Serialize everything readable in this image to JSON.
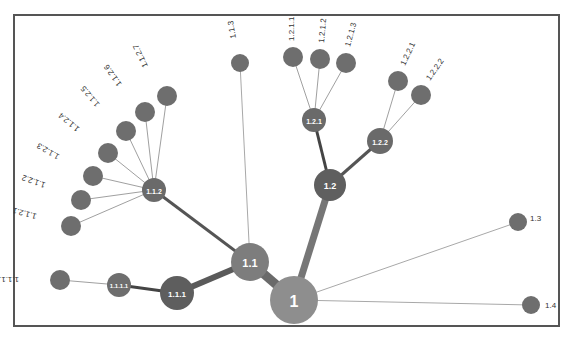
{
  "diagram": {
    "type": "radial-tree",
    "colors": {
      "root": "#8e8e8e",
      "mid": "#7a7a7a",
      "dark": "#5e5e5e",
      "leaf": "#6e6e6e",
      "edge_thin": "#9a9a9a",
      "edge_thick": "#5a5a5a",
      "border": "#555555"
    },
    "nodes": [
      {
        "id": "1",
        "label": "1",
        "x": 294,
        "y": 300,
        "r": 24,
        "fill": "#8e8e8e",
        "inside": true,
        "fs": 16
      },
      {
        "id": "1.1",
        "label": "1.1",
        "x": 250,
        "y": 262,
        "r": 19,
        "fill": "#7d7d7d",
        "inside": true,
        "fs": 11
      },
      {
        "id": "1.2",
        "label": "1.2",
        "x": 330,
        "y": 185,
        "r": 16,
        "fill": "#5f5f5f",
        "inside": true,
        "fs": 9
      },
      {
        "id": "1.3",
        "label": "1.3",
        "x": 518,
        "y": 222,
        "r": 9,
        "fill": "#6e6e6e",
        "inside": false,
        "lx": 530,
        "ly": 221,
        "rot": 0
      },
      {
        "id": "1.4",
        "label": "1.4",
        "x": 531,
        "y": 305,
        "r": 9,
        "fill": "#6e6e6e",
        "inside": false,
        "lx": 545,
        "ly": 308,
        "rot": 0
      },
      {
        "id": "1.1.1",
        "label": "1.1.1",
        "x": 177,
        "y": 293,
        "r": 17,
        "fill": "#5e5e5e",
        "inside": true,
        "fs": 8
      },
      {
        "id": "1.1.2",
        "label": "1.1.2",
        "x": 154,
        "y": 190,
        "r": 12,
        "fill": "#6a6a6a",
        "inside": true,
        "fs": 7
      },
      {
        "id": "1.1.3",
        "label": "1.1.3",
        "x": 240,
        "y": 63,
        "r": 9,
        "fill": "#6e6e6e",
        "inside": false,
        "lx": 236,
        "ly": 38,
        "rot": 260
      },
      {
        "id": "1.1.1.1",
        "label": "1.1.1.1",
        "x": 119,
        "y": 285,
        "r": 12,
        "fill": "#6e6e6e",
        "inside": true,
        "fs": 6
      },
      {
        "id": "1.1.1.1.1",
        "label": "1.1.1.1.1",
        "x": 60,
        "y": 280,
        "r": 10,
        "fill": "#6e6e6e",
        "inside": false,
        "lx": 19,
        "ly": 277,
        "rot": 180
      },
      {
        "id": "1.1.2.1",
        "label": "1.1.2.1",
        "x": 71,
        "y": 226,
        "r": 10,
        "fill": "#6e6e6e",
        "inside": false,
        "lx": 37,
        "ly": 214,
        "rot": 195
      },
      {
        "id": "1.1.2.2",
        "label": "1.1.2.2",
        "x": 81,
        "y": 200,
        "r": 10,
        "fill": "#6e6e6e",
        "inside": false,
        "lx": 46,
        "ly": 183,
        "rot": 200
      },
      {
        "id": "1.1.2.3",
        "label": "1.1.2.3",
        "x": 93,
        "y": 176,
        "r": 10,
        "fill": "#6e6e6e",
        "inside": false,
        "lx": 60,
        "ly": 155,
        "rot": 210
      },
      {
        "id": "1.1.2.4",
        "label": "1.1.2.4",
        "x": 108,
        "y": 153,
        "r": 10,
        "fill": "#6e6e6e",
        "inside": false,
        "lx": 80,
        "ly": 128,
        "rot": 220
      },
      {
        "id": "1.1.2.5",
        "label": "1.1.2.5",
        "x": 126,
        "y": 131,
        "r": 10,
        "fill": "#6e6e6e",
        "inside": false,
        "lx": 100,
        "ly": 104,
        "rot": 230
      },
      {
        "id": "1.1.2.6",
        "label": "1.1.2.6",
        "x": 145,
        "y": 112,
        "r": 10,
        "fill": "#6e6e6e",
        "inside": false,
        "lx": 122,
        "ly": 84,
        "rot": 235
      },
      {
        "id": "1.1.2.7",
        "label": "1.1.2.7",
        "x": 167,
        "y": 96,
        "r": 10,
        "fill": "#6e6e6e",
        "inside": false,
        "lx": 148,
        "ly": 66,
        "rot": 245
      },
      {
        "id": "1.2.1",
        "label": "1.2.1",
        "x": 314,
        "y": 120,
        "r": 12,
        "fill": "#6a6a6a",
        "inside": true,
        "fs": 7
      },
      {
        "id": "1.2.2",
        "label": "1.2.2",
        "x": 380,
        "y": 141,
        "r": 13,
        "fill": "#6a6a6a",
        "inside": true,
        "fs": 7
      },
      {
        "id": "1.2.1.1",
        "label": "1.2.1.1",
        "x": 293,
        "y": 57,
        "r": 10,
        "fill": "#6e6e6e",
        "inside": false,
        "lx": 294,
        "ly": 41,
        "rot": -90
      },
      {
        "id": "1.2.1.2",
        "label": "1.2.1.2",
        "x": 320,
        "y": 59,
        "r": 10,
        "fill": "#6e6e6e",
        "inside": false,
        "lx": 324,
        "ly": 43,
        "rot": -85
      },
      {
        "id": "1.2.1.3",
        "label": "1.2.1.3",
        "x": 346,
        "y": 63,
        "r": 10,
        "fill": "#6e6e6e",
        "inside": false,
        "lx": 350,
        "ly": 47,
        "rot": -75
      },
      {
        "id": "1.2.2.1",
        "label": "1.2.2.1",
        "x": 398,
        "y": 81,
        "r": 10,
        "fill": "#6e6e6e",
        "inside": false,
        "lx": 405,
        "ly": 66,
        "rot": -65
      },
      {
        "id": "1.2.2.2",
        "label": "1.2.2.2",
        "x": 421,
        "y": 95,
        "r": 10,
        "fill": "#6e6e6e",
        "inside": false,
        "lx": 430,
        "ly": 81,
        "rot": -55
      }
    ],
    "edges": [
      {
        "from": "1",
        "to": "1.1",
        "w": 9,
        "color": "#6a6a6a"
      },
      {
        "from": "1",
        "to": "1.2",
        "w": 7,
        "color": "#767676"
      },
      {
        "from": "1",
        "to": "1.3",
        "w": 1,
        "color": "#a8a8a8"
      },
      {
        "from": "1",
        "to": "1.4",
        "w": 1,
        "color": "#a8a8a8"
      },
      {
        "from": "1.1",
        "to": "1.1.1",
        "w": 6,
        "color": "#5a5a5a"
      },
      {
        "from": "1.1",
        "to": "1.1.2",
        "w": 3,
        "color": "#555555"
      },
      {
        "from": "1.1",
        "to": "1.1.3",
        "w": 1,
        "color": "#a8a8a8"
      },
      {
        "from": "1.1.1",
        "to": "1.1.1.1",
        "w": 3,
        "color": "#444444"
      },
      {
        "from": "1.1.1.1",
        "to": "1.1.1.1.1",
        "w": 1,
        "color": "#a0a0a0"
      },
      {
        "from": "1.1.2",
        "to": "1.1.2.1",
        "w": 1,
        "color": "#a0a0a0"
      },
      {
        "from": "1.1.2",
        "to": "1.1.2.2",
        "w": 1,
        "color": "#a0a0a0"
      },
      {
        "from": "1.1.2",
        "to": "1.1.2.3",
        "w": 1,
        "color": "#a0a0a0"
      },
      {
        "from": "1.1.2",
        "to": "1.1.2.4",
        "w": 1,
        "color": "#a0a0a0"
      },
      {
        "from": "1.1.2",
        "to": "1.1.2.5",
        "w": 1,
        "color": "#a0a0a0"
      },
      {
        "from": "1.1.2",
        "to": "1.1.2.6",
        "w": 1,
        "color": "#a0a0a0"
      },
      {
        "from": "1.1.2",
        "to": "1.1.2.7",
        "w": 1,
        "color": "#a0a0a0"
      },
      {
        "from": "1.2",
        "to": "1.2.1",
        "w": 3,
        "color": "#444444"
      },
      {
        "from": "1.2",
        "to": "1.2.2",
        "w": 3,
        "color": "#555555"
      },
      {
        "from": "1.2.1",
        "to": "1.2.1.1",
        "w": 1,
        "color": "#a0a0a0"
      },
      {
        "from": "1.2.1",
        "to": "1.2.1.2",
        "w": 1,
        "color": "#a0a0a0"
      },
      {
        "from": "1.2.1",
        "to": "1.2.1.3",
        "w": 1,
        "color": "#a0a0a0"
      },
      {
        "from": "1.2.2",
        "to": "1.2.2.1",
        "w": 1,
        "color": "#a0a0a0"
      },
      {
        "from": "1.2.2",
        "to": "1.2.2.2",
        "w": 1,
        "color": "#a0a0a0"
      }
    ]
  }
}
